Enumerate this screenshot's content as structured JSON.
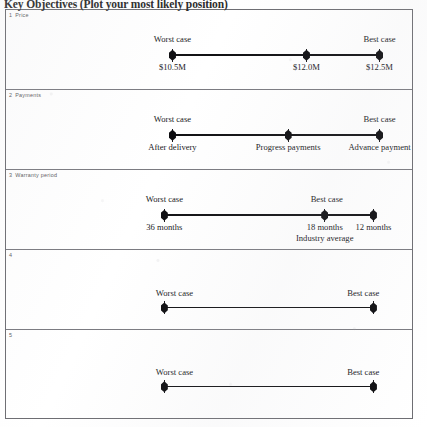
{
  "document": {
    "title": "Key Objectives (Plot your most likely position)"
  },
  "panels": [
    {
      "number": "1",
      "title": "Price",
      "line": {
        "x_start_pct": 41.0,
        "x_end_pct": 92.0,
        "y_pct": 56.0
      },
      "cap_labels": [
        {
          "text": "Worst case",
          "x_pct": 41.0,
          "y_pct": 30.0
        },
        {
          "text": "Best case",
          "x_pct": 92.0,
          "y_pct": 30.0
        }
      ],
      "markers": [
        {
          "x_pct": 41.0,
          "value": "$10.5M",
          "sub": ""
        },
        {
          "x_pct": 74.0,
          "value": "$12.0M",
          "sub": ""
        },
        {
          "x_pct": 92.0,
          "value": "$12.5M",
          "sub": ""
        }
      ]
    },
    {
      "number": "2",
      "title": "Payments",
      "line": {
        "x_start_pct": 41.0,
        "x_end_pct": 92.0,
        "y_pct": 56.0
      },
      "cap_labels": [
        {
          "text": "Worst case",
          "x_pct": 41.0,
          "y_pct": 30.0
        },
        {
          "text": "Best case",
          "x_pct": 92.0,
          "y_pct": 30.0
        }
      ],
      "markers": [
        {
          "x_pct": 41.0,
          "value": "After delivery",
          "sub": ""
        },
        {
          "x_pct": 69.5,
          "value": "Progress payments",
          "sub": ""
        },
        {
          "x_pct": 92.0,
          "value": "Advance payment",
          "sub": ""
        }
      ]
    },
    {
      "number": "3",
      "title": "Warranty period",
      "line": {
        "x_start_pct": 39.0,
        "x_end_pct": 90.5,
        "y_pct": 56.0
      },
      "cap_labels": [
        {
          "text": "Worst case",
          "x_pct": 39.0,
          "y_pct": 30.0
        },
        {
          "text": "Best case",
          "x_pct": 79.0,
          "y_pct": 30.0
        }
      ],
      "markers": [
        {
          "x_pct": 39.0,
          "value": "36 months",
          "sub": ""
        },
        {
          "x_pct": 78.5,
          "value": "18 months",
          "sub": "Industry average"
        },
        {
          "x_pct": 90.5,
          "value": "12 months",
          "sub": ""
        }
      ]
    },
    {
      "number": "4",
      "title": "",
      "line": {
        "x_start_pct": 39.0,
        "x_end_pct": 90.5,
        "y_pct": 72.0
      },
      "cap_labels": [
        {
          "text": "Worst case",
          "x_pct": 41.5,
          "y_pct": 48.0
        },
        {
          "text": "Best case",
          "x_pct": 88.0,
          "y_pct": 48.0
        }
      ],
      "markers": [
        {
          "x_pct": 39.0,
          "value": "",
          "sub": ""
        },
        {
          "x_pct": 90.5,
          "value": "",
          "sub": ""
        }
      ]
    },
    {
      "number": "5",
      "title": "",
      "line": {
        "x_start_pct": 39.0,
        "x_end_pct": 90.5,
        "y_pct": 62.0
      },
      "cap_labels": [
        {
          "text": "Worst case",
          "x_pct": 41.5,
          "y_pct": 41.0
        },
        {
          "text": "Best case",
          "x_pct": 88.0,
          "y_pct": 41.0
        }
      ],
      "markers": [
        {
          "x_pct": 39.0,
          "value": "",
          "sub": ""
        },
        {
          "x_pct": 90.5,
          "value": "",
          "sub": ""
        }
      ]
    }
  ]
}
